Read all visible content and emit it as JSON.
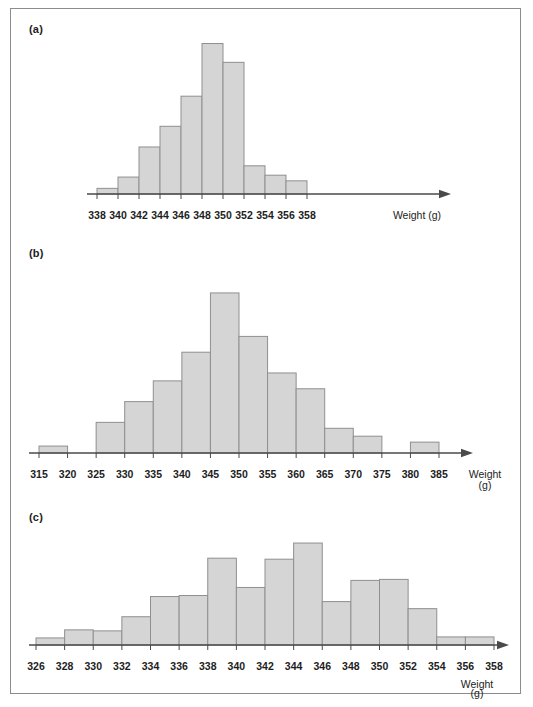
{
  "figure": {
    "caption": "",
    "frame_color": "#8c8c8c",
    "bar_fill": "#d5d5d5",
    "bar_stroke": "#8f8f8f",
    "axis_color": "#4a4a4a"
  },
  "panels": [
    {
      "label": "(a)",
      "axis_title_line1": "Weight (g)",
      "axis_title_line2": ""
    },
    {
      "label": "(b)",
      "axis_title_line1": "Weight",
      "axis_title_line2": "(g)"
    },
    {
      "label": "(c)",
      "axis_title_line1": "Weight",
      "axis_title_line2": "(g)"
    }
  ],
  "chart_data": [
    {
      "type": "bar",
      "panel": "(a)",
      "title": "",
      "xlabel": "Weight (g)",
      "ylabel": "",
      "grid": false,
      "legend": "none",
      "bin_width": 2,
      "xlim": [
        338,
        358
      ],
      "tick_labels": [
        "338",
        "340",
        "342",
        "344",
        "346",
        "348",
        "350",
        "352",
        "354",
        "356",
        "358"
      ],
      "bin_edges": [
        338,
        340,
        342,
        344,
        346,
        348,
        350,
        352,
        354,
        356,
        358
      ],
      "categories": [
        "338-340",
        "340-342",
        "342-344",
        "344-346",
        "346-348",
        "348-350",
        "350-352",
        "352-354",
        "354-356",
        "356-358"
      ],
      "values": [
        3,
        9,
        25,
        36,
        52,
        80,
        70,
        15,
        10,
        7
      ],
      "ylim": [
        0,
        84
      ]
    },
    {
      "type": "bar",
      "panel": "(b)",
      "title": "",
      "xlabel": "Weight (g)",
      "ylabel": "",
      "grid": false,
      "legend": "none",
      "bin_width": 5,
      "xlim": [
        315,
        385
      ],
      "tick_labels": [
        "315",
        "320",
        "325",
        "330",
        "335",
        "340",
        "345",
        "350",
        "355",
        "360",
        "365",
        "370",
        "375",
        "380",
        "385"
      ],
      "bin_edges": [
        315,
        320,
        325,
        330,
        335,
        340,
        345,
        350,
        355,
        360,
        365,
        370,
        375,
        380,
        385
      ],
      "categories": [
        "315-320",
        "320-325",
        "325-330",
        "330-335",
        "335-340",
        "340-345",
        "345-350",
        "350-355",
        "355-360",
        "360-365",
        "365-370",
        "370-375",
        "375-380",
        "380-385"
      ],
      "values": [
        7,
        0,
        31,
        52,
        73,
        102,
        162,
        118,
        81,
        65,
        25,
        17,
        0,
        11
      ],
      "ylim": [
        0,
        168
      ]
    },
    {
      "type": "bar",
      "panel": "(c)",
      "title": "",
      "xlabel": "Weight (g)",
      "ylabel": "",
      "grid": false,
      "legend": "none",
      "bin_width": 2,
      "xlim": [
        326,
        358
      ],
      "tick_labels": [
        "326",
        "328",
        "330",
        "332",
        "334",
        "336",
        "338",
        "340",
        "342",
        "344",
        "346",
        "348",
        "350",
        "352",
        "354",
        "356",
        "358"
      ],
      "bin_edges": [
        326,
        328,
        330,
        332,
        334,
        336,
        338,
        340,
        342,
        344,
        346,
        348,
        350,
        352,
        354,
        356,
        358
      ],
      "categories": [
        "326-328",
        "328-330",
        "330-332",
        "332-334",
        "334-336",
        "336-338",
        "338-340",
        "340-342",
        "342-344",
        "344-346",
        "346-348",
        "348-350",
        "350-352",
        "352-354",
        "354-356",
        "356-358"
      ],
      "values": [
        7,
        15,
        14,
        28,
        48,
        49,
        86,
        57,
        85,
        101,
        43,
        64,
        65,
        36,
        8,
        8
      ],
      "ylim": [
        0,
        105
      ]
    }
  ]
}
